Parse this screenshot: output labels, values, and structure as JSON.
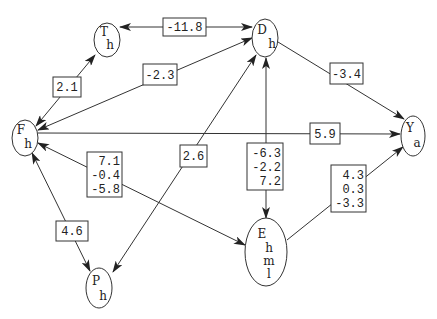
{
  "nodes": {
    "T": {
      "lines": [
        "T",
        "h"
      ]
    },
    "D": {
      "lines": [
        "D",
        "h"
      ]
    },
    "F": {
      "lines": [
        "F",
        "h"
      ]
    },
    "Y": {
      "lines": [
        "Y",
        "a"
      ]
    },
    "E": {
      "lines": [
        "E",
        "h",
        "m",
        "l"
      ]
    },
    "P": {
      "lines": [
        "P",
        "h"
      ]
    }
  },
  "edges": {
    "D_T": {
      "from": "D",
      "to": "T",
      "direction": "both",
      "labels": [
        "-11.8"
      ]
    },
    "F_T": {
      "from": "F",
      "to": "T",
      "direction": "both",
      "labels": [
        "2.1"
      ]
    },
    "D_F": {
      "from": "D",
      "to": "F",
      "direction": "both",
      "labels": [
        "-2.3"
      ]
    },
    "D_Y": {
      "from": "D",
      "to": "Y",
      "direction": "forward",
      "labels": [
        "-3.4"
      ]
    },
    "F_Y": {
      "from": "F",
      "to": "Y",
      "direction": "forward",
      "labels": [
        "5.9"
      ]
    },
    "E_F": {
      "from": "E",
      "to": "F",
      "direction": "both",
      "labels": [
        "7.1",
        "-0.4",
        "-5.8"
      ]
    },
    "F_P": {
      "from": "F",
      "to": "P",
      "direction": "both",
      "labels": [
        "4.6"
      ]
    },
    "P_D": {
      "from": "P",
      "to": "D",
      "direction": "both",
      "labels": [
        "2.6"
      ]
    },
    "D_E": {
      "from": "D",
      "to": "E",
      "direction": "both",
      "labels": [
        "-6.3",
        "-2.2",
        "7.2"
      ]
    },
    "E_Y": {
      "from": "E",
      "to": "Y",
      "direction": "forward",
      "labels": [
        "4.3",
        "0.3",
        "-3.3"
      ]
    }
  },
  "colors": {
    "stroke": "#333333",
    "background": "#ffffff"
  }
}
